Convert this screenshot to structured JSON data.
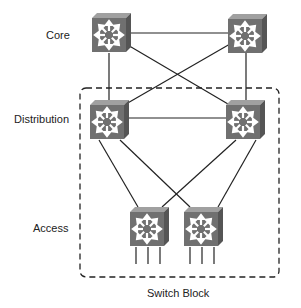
{
  "labels": {
    "core": "Core",
    "distribution": "Distribution",
    "access": "Access",
    "switch_block": "Switch Block"
  },
  "layers": [
    {
      "name": "Core",
      "switches": 2
    },
    {
      "name": "Distribution",
      "switches": 2
    },
    {
      "name": "Access",
      "switches": 2
    }
  ],
  "icons": {
    "switch": "multilayer-switch-icon"
  },
  "colors": {
    "switch_face": "#6e6e6e",
    "switch_top": "#9a9a9a",
    "switch_side": "#555555",
    "line": "#222222"
  }
}
